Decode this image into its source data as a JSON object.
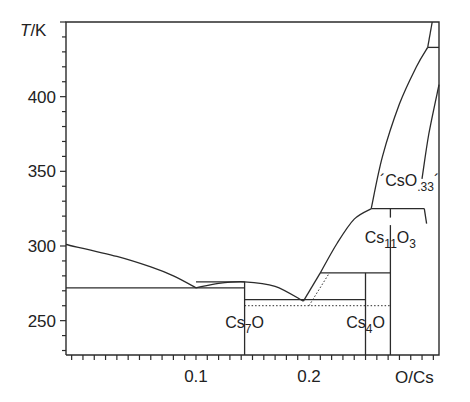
{
  "chart_data": {
    "type": "line",
    "title": "",
    "subtitle": "Cs–O phase diagram (Cs-rich region)",
    "xlabel": "O/Cs",
    "ylabel": "T/K",
    "xlim": [
      -0.015,
      0.315
    ],
    "ylim": [
      227,
      450
    ],
    "grid": false,
    "legend": null,
    "x_ticks": [
      {
        "value": 0.1,
        "label": "0.1"
      },
      {
        "value": 0.2,
        "label": "0.2"
      }
    ],
    "x_minor_tick_step": 0.01,
    "y_ticks": [
      {
        "value": 250,
        "label": "250"
      },
      {
        "value": 300,
        "label": "300"
      },
      {
        "value": 350,
        "label": "350"
      },
      {
        "value": 400,
        "label": "400"
      }
    ],
    "y_minor_tick_step": 10,
    "series": [
      {
        "name": "liquidus-Cs-side",
        "style": "solid",
        "x": [
          -0.015,
          0.03,
          0.06,
          0.08,
          0.1
        ],
        "y": [
          301,
          293,
          286,
          280,
          272
        ]
      },
      {
        "name": "eutectic-272K",
        "style": "solid",
        "x": [
          -0.015,
          0.143
        ],
        "y": [
          272,
          272
        ]
      },
      {
        "name": "Cs7O-liquidus",
        "style": "solid",
        "x": [
          0.1,
          0.12,
          0.143,
          0.17,
          0.195
        ],
        "y": [
          272,
          275,
          276,
          273,
          263
        ]
      },
      {
        "name": "Cs7O-peritectic-276K",
        "style": "solid",
        "x": [
          0.1,
          0.143
        ],
        "y": [
          276,
          276
        ]
      },
      {
        "name": "Cs7O-composition",
        "style": "solid",
        "x": [
          0.143,
          0.143
        ],
        "y": [
          227,
          276
        ]
      },
      {
        "name": "eutectic-263K",
        "style": "solid",
        "x": [
          0.143,
          0.25
        ],
        "y": [
          264,
          264
        ]
      },
      {
        "name": "transition-260K",
        "style": "dotted",
        "x": [
          0.143,
          0.272
        ],
        "y": [
          260,
          260
        ]
      },
      {
        "name": "liquidus-Cs4O",
        "style": "solid",
        "x": [
          0.195,
          0.21
        ],
        "y": [
          263,
          282
        ]
      },
      {
        "name": "metastable-liquidus",
        "style": "dotted",
        "x": [
          0.2,
          0.218
        ],
        "y": [
          260,
          282
        ]
      },
      {
        "name": "Cs4O-peritectic-282K",
        "style": "solid",
        "x": [
          0.21,
          0.272
        ],
        "y": [
          282,
          282
        ]
      },
      {
        "name": "Cs4O-composition",
        "style": "solid",
        "x": [
          0.25,
          0.25
        ],
        "y": [
          227,
          282
        ]
      },
      {
        "name": "liquidus-Cs11O3",
        "style": "solid",
        "x": [
          0.21,
          0.225,
          0.24,
          0.255
        ],
        "y": [
          282,
          302,
          318,
          325
        ]
      },
      {
        "name": "Cs11O3-peritectic-326K",
        "style": "solid",
        "x": [
          0.255,
          0.302
        ],
        "y": [
          325,
          325
        ]
      },
      {
        "name": "Cs11O3-composition",
        "style": "solid",
        "x": [
          0.272,
          0.272
        ],
        "y": [
          227,
          314
        ]
      },
      {
        "name": "Cs11O3-upper-tick",
        "style": "solid",
        "x": [
          0.272,
          0.272
        ],
        "y": [
          319,
          325
        ]
      },
      {
        "name": "CsO33-right-tick",
        "style": "solid",
        "x": [
          0.302,
          0.304
        ],
        "y": [
          325,
          315
        ]
      },
      {
        "name": "liquidus-CsO33",
        "style": "solid",
        "x": [
          0.255,
          0.265,
          0.28,
          0.295,
          0.305
        ],
        "y": [
          325,
          360,
          395,
          420,
          433
        ]
      },
      {
        "name": "upper-transition-433K",
        "style": "solid",
        "x": [
          0.305,
          0.315
        ],
        "y": [
          433,
          433
        ]
      },
      {
        "name": "upper-liquidus",
        "style": "solid",
        "x": [
          0.305,
          0.309
        ],
        "y": [
          433,
          450
        ]
      },
      {
        "name": "CsO33-solvus",
        "style": "solid",
        "x": [
          0.3,
          0.306,
          0.315
        ],
        "y": [
          345,
          375,
          408
        ]
      }
    ],
    "annotations": [
      {
        "text": "Cs",
        "sub": "7",
        "text2": "O",
        "x": 0.143,
        "y": 245
      },
      {
        "text": "Cs",
        "sub": "4",
        "text2": "O",
        "x": 0.25,
        "y": 245
      },
      {
        "text": "Cs",
        "sub": "11",
        "text2": "O",
        "sub2": "3",
        "x": 0.272,
        "y": 302
      },
      {
        "text": "´CsO",
        "sub": ".33",
        "text2": "´",
        "x": 0.289,
        "y": 340
      }
    ]
  },
  "layout": {
    "plot_px": {
      "left": 66,
      "right": 439,
      "top": 22,
      "bottom": 355
    }
  }
}
